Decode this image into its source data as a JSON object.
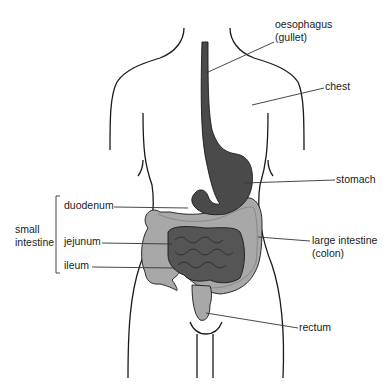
{
  "diagram": {
    "colors": {
      "outline": "#1a1a1a",
      "dark_organ": "#4a4a4a",
      "small_intestine": "#555555",
      "large_intestine": "#a8a8a8",
      "leader_line": "#333333",
      "background": "#ffffff"
    },
    "labels": {
      "oesophagus": "oesophagus",
      "oesophagus_alt": "(gullet)",
      "chest": "chest",
      "stomach": "stomach",
      "large_intestine": "large intestine",
      "large_intestine_alt": "(colon)",
      "rectum": "rectum",
      "small_intestine_line1": "small",
      "small_intestine_line2": "intestine",
      "duodenum": "duodenum",
      "jejunum": "jejunum",
      "ileum": "ileum"
    }
  }
}
